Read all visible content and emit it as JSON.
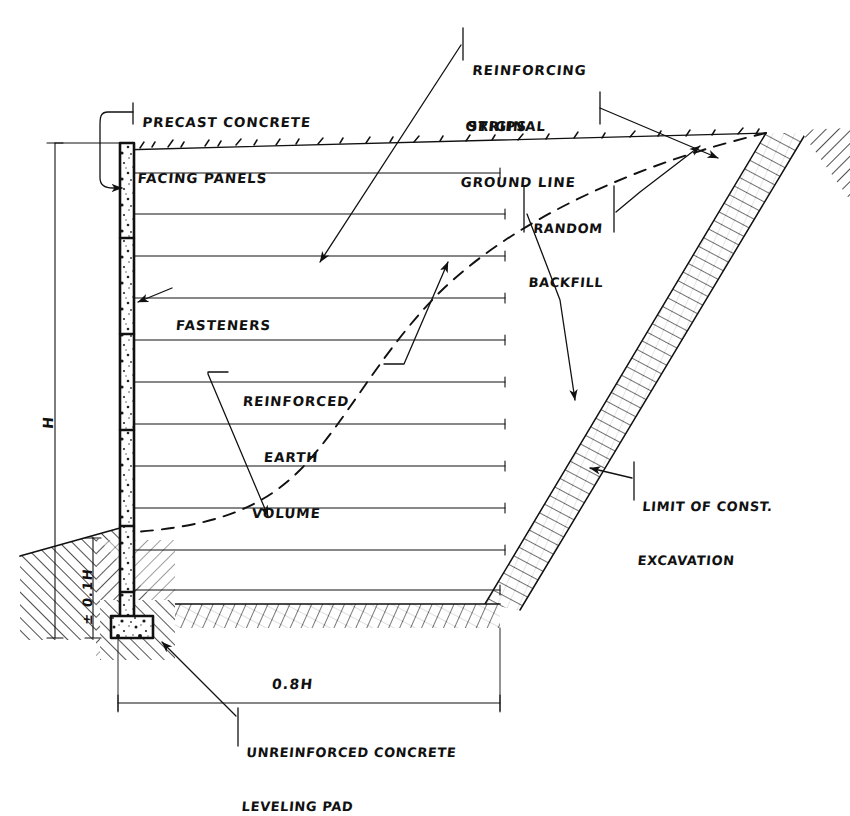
{
  "drawing": {
    "title": "Mechanically Stabilized Earth (MSE) Retaining Wall Section",
    "style": "hand-drawn engineering sketch",
    "ink_color": "#111111",
    "paper_color": "#ffffff"
  },
  "labels": {
    "precast_panels": {
      "line1": "PRECAST CONCRETE",
      "line2": "FACING PANELS"
    },
    "reinforcing_strips": {
      "line1": "REINFORCING",
      "line2": "STRIPS"
    },
    "original_ground_line": {
      "line1": "ORIGINAL",
      "line2": "GROUND LINE"
    },
    "random_backfill": {
      "line1": "RANDOM",
      "line2": "BACKFILL"
    },
    "fasteners": {
      "line1": "FASTENERS"
    },
    "reinforced_earth_volume": {
      "line1": "REINFORCED",
      "line2": "EARTH",
      "line3": "VOLUME"
    },
    "limit_of_excavation": {
      "line1": "LIMIT OF CONST.",
      "line2": "EXCAVATION"
    },
    "leveling_pad": {
      "line1": "UNREINFORCED CONCRETE",
      "line2": "LEVELING PAD"
    }
  },
  "dimensions": {
    "wall_height": "H",
    "embedment": "± 0.1H",
    "base_width": "0.8H"
  },
  "geometry": {
    "wall_x": 120,
    "wall_top_y": 143,
    "wall_bottom_y": 622,
    "wall_thickness": 14,
    "base_right_x": 500,
    "strip_count": 11,
    "panel_joint_count": 5
  }
}
